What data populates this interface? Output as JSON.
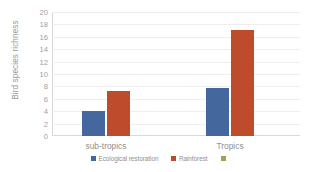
{
  "chart_data": {
    "type": "bar",
    "title": "",
    "xlabel": "",
    "ylabel": "Bird species richness",
    "categories": [
      "sub-tropics",
      "Tropics"
    ],
    "series": [
      {
        "name": "Ecological restoration",
        "color": "#44689E",
        "values": [
          4.0,
          7.8
        ]
      },
      {
        "name": "Rainforest",
        "color": "#BE4B2B",
        "values": [
          7.3,
          17.1
        ]
      },
      {
        "name": "",
        "color": "#A8A055",
        "values": [
          null,
          null
        ]
      }
    ],
    "ylim": [
      0,
      20
    ],
    "yticks": [
      0,
      2,
      4,
      6,
      8,
      10,
      12,
      14,
      16,
      18,
      20
    ],
    "ytick_labels": [
      "0",
      "2",
      "4",
      "6",
      "8",
      "10",
      "12",
      "14",
      "16",
      "18",
      "20"
    ],
    "grid": true,
    "grid_axis": "y",
    "legend_position": "bottom",
    "axis_color": "#d9d9d9",
    "grid_color": "#eceef0",
    "tick_label_color": "#a0a0a0",
    "background": "#ffffff"
  }
}
